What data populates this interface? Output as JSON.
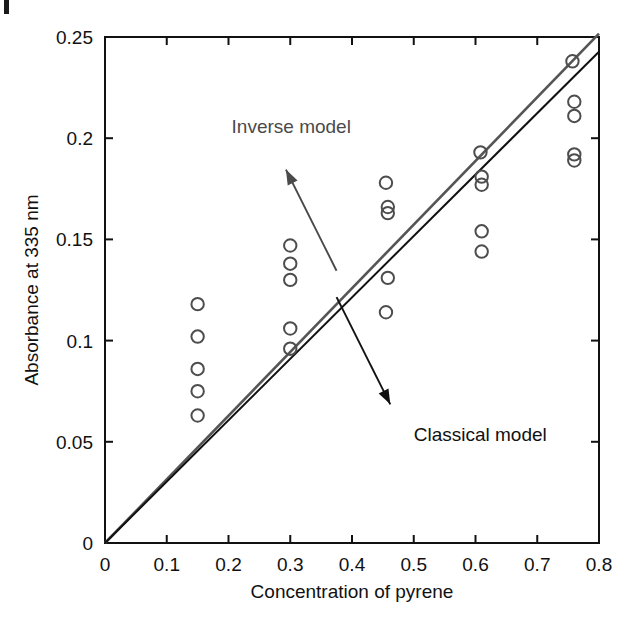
{
  "figure": {
    "corner_mark": "page-corner-rule"
  },
  "chart_data": {
    "type": "scatter",
    "title": "",
    "xlabel": "Concentration of pyrene",
    "ylabel": "Absorbance at 335 nm",
    "xlim": [
      0,
      0.8
    ],
    "ylim": [
      0,
      0.25
    ],
    "xticks": [
      0,
      0.1,
      0.2,
      0.3,
      0.4,
      0.5,
      0.6,
      0.7,
      0.8
    ],
    "xtick_labels": [
      "0",
      "0.1",
      "0.2",
      "0.3",
      "0.4",
      "0.5",
      "0.6",
      "0.7",
      "0.8"
    ],
    "yticks": [
      0,
      0.05,
      0.1,
      0.15,
      0.2,
      0.25
    ],
    "ytick_labels": [
      "0",
      "0.05",
      "0.1",
      "0.15",
      "0.2",
      "0.25"
    ],
    "grid": false,
    "legend": "annotations",
    "marker": "open-circle",
    "marker_color": "#4d4d4d",
    "points": [
      {
        "x": 0.15,
        "y": 0.118
      },
      {
        "x": 0.15,
        "y": 0.102
      },
      {
        "x": 0.15,
        "y": 0.086
      },
      {
        "x": 0.15,
        "y": 0.075
      },
      {
        "x": 0.15,
        "y": 0.063
      },
      {
        "x": 0.3,
        "y": 0.147
      },
      {
        "x": 0.3,
        "y": 0.138
      },
      {
        "x": 0.3,
        "y": 0.13
      },
      {
        "x": 0.3,
        "y": 0.106
      },
      {
        "x": 0.3,
        "y": 0.096
      },
      {
        "x": 0.455,
        "y": 0.178
      },
      {
        "x": 0.458,
        "y": 0.166
      },
      {
        "x": 0.458,
        "y": 0.163
      },
      {
        "x": 0.458,
        "y": 0.131
      },
      {
        "x": 0.455,
        "y": 0.114
      },
      {
        "x": 0.608,
        "y": 0.193
      },
      {
        "x": 0.61,
        "y": 0.181
      },
      {
        "x": 0.61,
        "y": 0.177
      },
      {
        "x": 0.61,
        "y": 0.154
      },
      {
        "x": 0.61,
        "y": 0.144
      },
      {
        "x": 0.757,
        "y": 0.238
      },
      {
        "x": 0.76,
        "y": 0.218
      },
      {
        "x": 0.76,
        "y": 0.211
      },
      {
        "x": 0.76,
        "y": 0.192
      },
      {
        "x": 0.76,
        "y": 0.189
      }
    ],
    "series": [
      {
        "name": "Inverse model",
        "type": "line",
        "color": "#555555",
        "slope": 0.3146,
        "intercept": 0.0,
        "x": [
          0,
          0.8
        ],
        "y": [
          0.0,
          0.2517
        ]
      },
      {
        "name": "Classical model",
        "type": "line",
        "color": "#111111",
        "slope": 0.3034,
        "intercept": 0.0,
        "x": [
          0,
          0.8
        ],
        "y": [
          0.0,
          0.2427
        ]
      }
    ],
    "annotations": [
      {
        "label": "Inverse model",
        "text_x": 0.205,
        "text_y": 0.2025,
        "arrow_from_x": 0.375,
        "arrow_from_y": 0.1345,
        "arrow_to_x": 0.293,
        "arrow_to_y": 0.1845,
        "color": "#4a4a4a"
      },
      {
        "label": "Classical model",
        "text_x": 0.5,
        "text_y": 0.0505,
        "arrow_from_x": 0.375,
        "arrow_from_y": 0.1215,
        "arrow_to_x": 0.462,
        "arrow_to_y": 0.0685,
        "color": "#111111"
      }
    ]
  }
}
